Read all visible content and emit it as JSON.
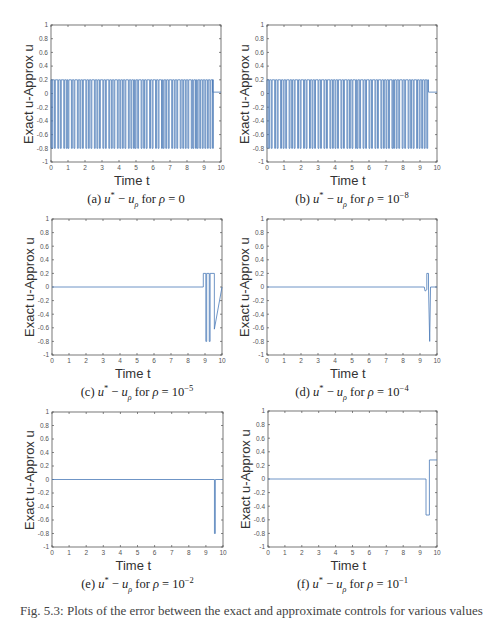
{
  "figure": {
    "line_color": "#4a7ab8",
    "axis_color": "#555555",
    "tick_label_color": "#555555",
    "bottom_text": "Fig. 5.3: Plots of the error between the exact and approximate controls for various values"
  },
  "chart_data": [
    {
      "id": "a",
      "type": "line",
      "title": "(a) u* − u_ρ for ρ = 0",
      "caption": {
        "prefix": "(a)",
        "rho": "0",
        "exp": ""
      },
      "xlabel": "Time t",
      "ylabel": "Exact u-Approx u",
      "xlim": [
        0,
        10
      ],
      "ylim": [
        -1,
        1
      ],
      "xticks": [
        "0",
        "1",
        "2",
        "3",
        "4",
        "5",
        "6",
        "7",
        "8",
        "9",
        "10"
      ],
      "yticks": [
        "-1",
        "-0.8",
        "-0.6",
        "-0.4",
        "-0.2",
        "0",
        "0.2",
        "0.4",
        "0.6",
        "0.8",
        "1"
      ],
      "pattern": "bang-bang",
      "high": 0.2,
      "low": -0.8,
      "switch_start": 0,
      "switch_end": 9.5,
      "pulse_times": [
        0.05,
        0.2,
        0.4,
        0.55,
        0.75,
        0.9,
        1.0,
        1.2,
        1.35,
        1.55,
        1.7,
        1.85,
        2.05,
        2.2,
        2.35,
        2.55,
        2.7,
        2.85,
        3.05,
        3.2,
        3.4,
        3.55,
        3.7,
        3.9,
        4.05,
        4.2,
        4.35,
        4.55,
        4.7,
        4.85,
        4.95,
        5.1,
        5.3,
        5.45,
        5.6,
        5.8,
        5.95,
        6.15,
        6.3,
        6.5,
        6.6,
        6.75,
        6.9,
        7.1,
        7.25,
        7.4,
        7.6,
        7.75,
        7.9,
        8.05,
        8.25,
        8.35,
        8.5,
        8.6,
        8.75,
        8.9,
        9.05,
        9.2,
        9.35,
        9.5
      ],
      "tail": {
        "t": [
          9.5,
          10
        ],
        "y": [
          0.02,
          0.02
        ]
      }
    },
    {
      "id": "b",
      "type": "line",
      "title": "(b) u* − u_ρ for ρ = 10^-8",
      "caption": {
        "prefix": "(b)",
        "rho": "10",
        "exp": "−8"
      },
      "xlabel": "Time t",
      "ylabel": "Exact u-Approx u",
      "xlim": [
        0,
        10
      ],
      "ylim": [
        -1,
        1
      ],
      "xticks": [
        "0",
        "1",
        "2",
        "3",
        "4",
        "5",
        "6",
        "7",
        "8",
        "9",
        "10"
      ],
      "yticks": [
        "-1",
        "-0.8",
        "-0.6",
        "-0.4",
        "-0.2",
        "0",
        "0.2",
        "0.4",
        "0.6",
        "0.8",
        "1"
      ],
      "pattern": "bang-bang",
      "high": 0.2,
      "low": -0.8,
      "switch_start": 0,
      "switch_end": 9.5,
      "pulse_times": [
        0.1,
        0.25,
        0.45,
        0.6,
        0.8,
        0.95,
        1.1,
        1.3,
        1.45,
        1.6,
        1.8,
        1.95,
        2.15,
        2.3,
        2.5,
        2.65,
        2.8,
        3.0,
        3.15,
        3.35,
        3.5,
        3.7,
        3.85,
        4.0,
        4.15,
        4.35,
        4.5,
        4.7,
        4.85,
        5.0,
        5.2,
        5.3,
        5.45,
        5.65,
        5.8,
        6.0,
        6.15,
        6.35,
        6.5,
        6.7,
        6.85,
        7.0,
        7.15,
        7.35,
        7.45,
        7.6,
        7.75,
        7.95,
        8.1,
        8.3,
        8.45,
        8.6,
        8.8,
        8.95,
        9.1,
        9.25,
        9.4
      ],
      "tail": {
        "t": [
          9.5,
          10
        ],
        "y": [
          0.02,
          0.02
        ]
      }
    },
    {
      "id": "c",
      "type": "line",
      "title": "(c) u* − u_ρ for ρ = 10^-5",
      "caption": {
        "prefix": "(c)",
        "rho": "10",
        "exp": "−5"
      },
      "xlabel": "Time t",
      "ylabel": "Exact u-Approx u",
      "xlim": [
        0,
        10
      ],
      "ylim": [
        -1,
        1
      ],
      "xticks": [
        "0",
        "1",
        "2",
        "3",
        "4",
        "5",
        "6",
        "7",
        "8",
        "9",
        "10"
      ],
      "yticks": [
        "-1",
        "-0.8",
        "-0.6",
        "-0.4",
        "-0.2",
        "0",
        "0.2",
        "0.4",
        "0.6",
        "0.8",
        "1"
      ],
      "pattern": "step",
      "t": [
        0,
        8.9,
        8.9,
        9.05,
        9.05,
        9.1,
        9.1,
        9.25,
        9.25,
        9.3,
        9.3,
        9.55,
        9.55,
        10
      ],
      "y": [
        0,
        0,
        0.2,
        0.2,
        -0.8,
        -0.8,
        0.2,
        0.2,
        -0.8,
        -0.8,
        0.2,
        0.2,
        -0.62,
        0
      ]
    },
    {
      "id": "d",
      "type": "line",
      "title": "(d) u* − u_ρ for ρ = 10^-4",
      "caption": {
        "prefix": "(d)",
        "rho": "10",
        "exp": "−4"
      },
      "xlabel": "Time t",
      "ylabel": "Exact u-Approx u",
      "xlim": [
        0,
        10
      ],
      "ylim": [
        -1,
        1
      ],
      "xticks": [
        "0",
        "1",
        "2",
        "3",
        "4",
        "5",
        "6",
        "7",
        "8",
        "9",
        "10"
      ],
      "yticks": [
        "-1",
        "-0.8",
        "-0.6",
        "-0.4",
        "-0.2",
        "0",
        "0.2",
        "0.4",
        "0.6",
        "0.8",
        "1"
      ],
      "pattern": "step",
      "t": [
        0,
        9.25,
        9.3,
        9.4,
        9.4,
        9.5,
        9.5,
        9.57,
        9.57,
        9.62,
        10
      ],
      "y": [
        0,
        0,
        -0.06,
        -0.04,
        0.2,
        0.2,
        0,
        -0.8,
        -0.8,
        0,
        0
      ]
    },
    {
      "id": "e",
      "type": "line",
      "title": "(e) u* − u_ρ for ρ = 10^-2",
      "caption": {
        "prefix": "(e)",
        "rho": "10",
        "exp": "−2"
      },
      "xlabel": "Time t",
      "ylabel": "Exact u-Approx u",
      "xlim": [
        0,
        10
      ],
      "ylim": [
        -1,
        1
      ],
      "xticks": [
        "0",
        "1",
        "2",
        "3",
        "4",
        "5",
        "6",
        "7",
        "8",
        "9",
        "10"
      ],
      "yticks": [
        "-1",
        "-0.8",
        "-0.6",
        "-0.4",
        "-0.2",
        "0",
        "0.2",
        "0.4",
        "0.6",
        "0.8",
        "1"
      ],
      "pattern": "step",
      "t": [
        0,
        9.5,
        9.5,
        9.55,
        9.55,
        10
      ],
      "y": [
        0,
        0,
        -0.8,
        -0.8,
        0,
        0
      ]
    },
    {
      "id": "f",
      "type": "line",
      "title": "(f) u* − u_ρ for ρ = 10^-1",
      "caption": {
        "prefix": "(f)",
        "rho": "10",
        "exp": "−1"
      },
      "xlabel": "Time t",
      "ylabel": "Exact u-Approx u",
      "xlim": [
        0,
        10
      ],
      "ylim": [
        -1,
        1
      ],
      "xticks": [
        "0",
        "1",
        "2",
        "3",
        "4",
        "5",
        "6",
        "7",
        "8",
        "9",
        "10"
      ],
      "yticks": [
        "-1",
        "-0.8",
        "-0.6",
        "-0.4",
        "-0.2",
        "0",
        "0.2",
        "0.4",
        "0.6",
        "0.8",
        "1"
      ],
      "pattern": "step",
      "t": [
        0,
        9.35,
        9.35,
        9.55,
        9.55,
        10
      ],
      "y": [
        0,
        0,
        -0.53,
        -0.53,
        0.28,
        0.28
      ]
    }
  ]
}
